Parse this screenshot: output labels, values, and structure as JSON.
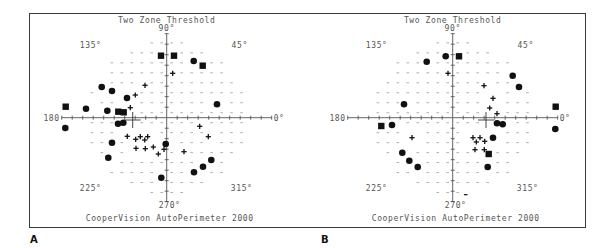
{
  "figure": {
    "panels": [
      {
        "letter": "A"
      },
      {
        "letter": "B"
      }
    ]
  },
  "chart_data": [
    {
      "type": "scatter",
      "panel": "A",
      "title": "Two Zone Threshold",
      "footer": "CooperVision  AutoPerimeter 2000",
      "angle_labels": {
        "0": "0°",
        "45": "45°",
        "90": "90°",
        "135": "135°",
        "180": "180",
        "225": "225°",
        "270": "270°",
        "315": "315°"
      },
      "axes": {
        "center_px": [
          166.7,
          117.7
        ],
        "radius_px": 108,
        "tick_spacing_px": 10.5,
        "ticks_per_side": 10
      },
      "legend_symbols": {
        "square": "absolute defect",
        "circle": "relative defect",
        "plus": "relative defect (mild)",
        "dash": "seen"
      },
      "fixation_cross": [
        132.7,
        120
      ],
      "series": [
        {
          "name": "squares",
          "symbol": "square",
          "points": [
            [
              161,
              55.7
            ],
            [
              174,
              55.7
            ],
            [
              202.7,
              65.7
            ],
            [
              65.7,
              106.7
            ],
            [
              118.3,
              111.7
            ],
            [
              123.7,
              112.3
            ]
          ]
        },
        {
          "name": "circles",
          "symbol": "circle",
          "points": [
            [
              193.7,
              61
            ],
            [
              101.7,
              87
            ],
            [
              112,
              91
            ],
            [
              127,
              98
            ],
            [
              217,
              104.3
            ],
            [
              86,
              108.7
            ],
            [
              107.3,
              110.7
            ],
            [
              65.3,
              128
            ],
            [
              118,
              123.7
            ],
            [
              123.3,
              122.7
            ],
            [
              112,
              142.7
            ],
            [
              108.3,
              157.7
            ],
            [
              165.7,
              144
            ],
            [
              211.3,
              160
            ],
            [
              203,
              166.7
            ],
            [
              194,
              172.3
            ],
            [
              161.3,
              177.7
            ]
          ]
        },
        {
          "name": "plus",
          "symbol": "plus",
          "points": [
            [
              172.7,
              73.3
            ],
            [
              145,
              85.3
            ],
            [
              135.3,
              95
            ],
            [
              130.3,
              107.7
            ],
            [
              127.3,
              136.3
            ],
            [
              135.7,
              139.3
            ],
            [
              140.3,
              136.7
            ],
            [
              144.7,
              140
            ],
            [
              147.7,
              136.7
            ],
            [
              136,
              148.3
            ],
            [
              145.3,
              148.7
            ],
            [
              153.3,
              147
            ],
            [
              158.3,
              154
            ],
            [
              164,
              149.3
            ],
            [
              184,
              151.7
            ],
            [
              199.7,
              126.3
            ],
            [
              208.3,
              136.7
            ]
          ]
        }
      ]
    },
    {
      "type": "scatter",
      "panel": "B",
      "title": "Two Zone Threshold",
      "footer": "CooperVision  AutoPerimeter 2000",
      "angle_labels": {
        "0": "0°",
        "45": "45°",
        "90": "90°",
        "135": "135°",
        "180": "180",
        "225": "225°",
        "270": "270°",
        "315": "315°"
      },
      "axes": {
        "center_px": [
          452.7,
          117.7
        ],
        "radius_px": 108,
        "tick_spacing_px": 10.5,
        "ticks_per_side": 10
      },
      "legend_symbols": {
        "square": "absolute defect",
        "circle": "relative defect",
        "plus": "relative defect (mild)",
        "dash": "seen"
      },
      "fixation_cross": [
        486,
        120
      ],
      "series": [
        {
          "name": "squares",
          "symbol": "square",
          "points": [
            [
              459,
              56.3
            ],
            [
              555.7,
              106.7
            ],
            [
              381.3,
              126
            ],
            [
              488.7,
              154
            ]
          ]
        },
        {
          "name": "circles",
          "symbol": "circle",
          "points": [
            [
              445.7,
              56.3
            ],
            [
              426.7,
              61.7
            ],
            [
              512.7,
              75.7
            ],
            [
              519,
              87
            ],
            [
              404,
              104.3
            ],
            [
              392,
              125
            ],
            [
              497,
              123.3
            ],
            [
              502.7,
              124.3
            ],
            [
              555.3,
              129
            ],
            [
              493,
              137.7
            ],
            [
              402.3,
              152.7
            ],
            [
              409.3,
              160.7
            ],
            [
              417.7,
              167
            ],
            [
              487.7,
              167
            ]
          ]
        },
        {
          "name": "plus",
          "symbol": "plus",
          "points": [
            [
              448,
              73.3
            ],
            [
              484,
              85.7
            ],
            [
              493,
              98.3
            ],
            [
              489.7,
              108
            ],
            [
              497,
              113.7
            ],
            [
              412,
              137.7
            ],
            [
              473,
              137.7
            ],
            [
              480,
              137.7
            ],
            [
              476.3,
              142
            ],
            [
              484.7,
              141.3
            ],
            [
              475,
              149.7
            ],
            [
              484.3,
              149.7
            ]
          ]
        },
        {
          "name": "dash-extra",
          "symbol": "dash",
          "points": [
            [
              465.7,
              194.7
            ]
          ]
        }
      ]
    }
  ]
}
